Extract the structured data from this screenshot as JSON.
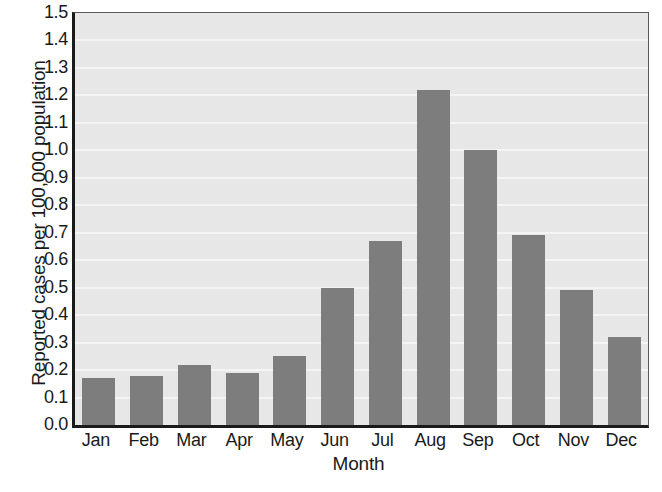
{
  "chart_data": {
    "type": "bar",
    "title": "",
    "xlabel": "Month",
    "ylabel": "Reported cases per 100,000 population",
    "categories": [
      "Jan",
      "Feb",
      "Mar",
      "Apr",
      "May",
      "Jun",
      "Jul",
      "Aug",
      "Sep",
      "Oct",
      "Nov",
      "Dec"
    ],
    "values": [
      0.17,
      0.18,
      0.22,
      0.19,
      0.25,
      0.5,
      0.67,
      1.22,
      1.0,
      0.69,
      0.49,
      0.32
    ],
    "ylim": [
      0.0,
      1.5
    ],
    "ytick_labels": [
      "1.5",
      "1.4",
      "1.3",
      "1.2",
      "1.1",
      "1.0",
      "0.9",
      "0.8",
      "0.7",
      "0.6",
      "0.5",
      "0.4",
      "0.3",
      "0.2",
      "0.1",
      "0.0"
    ],
    "ytick_values": [
      1.5,
      1.4,
      1.3,
      1.2,
      1.1,
      1.0,
      0.9,
      0.8,
      0.7,
      0.6,
      0.5,
      0.4,
      0.3,
      0.2,
      0.1,
      0.0
    ],
    "ytick_step": 0.1,
    "grid": true,
    "legend": false,
    "legend_position": "none",
    "colors": {
      "bar": "#7d7d7d",
      "plot_background": "#e7e7e7",
      "gridline": "#f4f4f4",
      "axis": "#1a1a1a",
      "text": "#1a1a1a",
      "figure_background": "#ffffff"
    }
  }
}
